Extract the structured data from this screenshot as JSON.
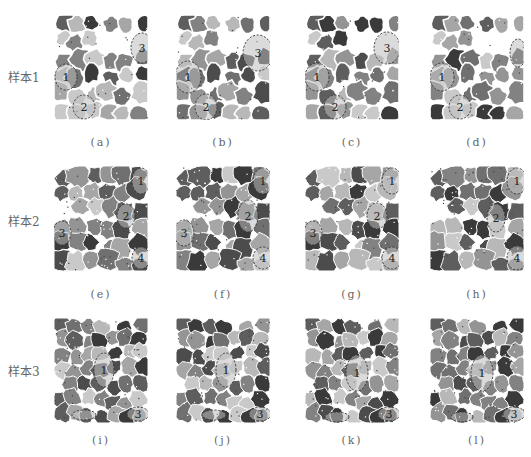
{
  "figure": {
    "rows": [
      {
        "label": "样本1",
        "panels": [
          {
            "caption": "(a)",
            "markers": [
              {
                "n": "1",
                "x": 12,
                "y": 62,
                "rx": 11,
                "ry": 13
              },
              {
                "n": "2",
                "x": 30,
                "y": 92,
                "rx": 11,
                "ry": 12
              },
              {
                "n": "3",
                "x": 88,
                "y": 33,
                "rx": 11,
                "ry": 15
              }
            ]
          },
          {
            "caption": "(b)",
            "markers": [
              {
                "n": "1",
                "x": 12,
                "y": 62,
                "rx": 13,
                "ry": 16
              },
              {
                "n": "2",
                "x": 30,
                "y": 92,
                "rx": 11,
                "ry": 13
              },
              {
                "n": "3",
                "x": 82,
                "y": 38,
                "rx": 15,
                "ry": 18
              }
            ]
          },
          {
            "caption": "(c)",
            "markers": [
              {
                "n": "1",
                "x": 12,
                "y": 62,
                "rx": 12,
                "ry": 14
              },
              {
                "n": "2",
                "x": 30,
                "y": 92,
                "rx": 11,
                "ry": 12
              },
              {
                "n": "3",
                "x": 82,
                "y": 33,
                "rx": 13,
                "ry": 16
              }
            ]
          },
          {
            "caption": "(d)",
            "markers": [
              {
                "n": "1",
                "x": 12,
                "y": 62,
                "rx": 12,
                "ry": 14
              },
              {
                "n": "2",
                "x": 30,
                "y": 92,
                "rx": 11,
                "ry": 12
              },
              {
                "n": "",
                "x": 88,
                "y": 38,
                "rx": 8,
                "ry": 14
              }
            ]
          }
        ]
      },
      {
        "label": "样本2",
        "panels": [
          {
            "caption": "(e)",
            "markers": [
              {
                "n": "1",
                "x": 87,
                "y": 15,
                "rx": 9,
                "ry": 13
              },
              {
                "n": "2",
                "x": 72,
                "y": 50,
                "rx": 9,
                "ry": 12
              },
              {
                "n": "3",
                "x": 8,
                "y": 67,
                "rx": 9,
                "ry": 12
              },
              {
                "n": "4",
                "x": 87,
                "y": 92,
                "rx": 9,
                "ry": 11
              }
            ]
          },
          {
            "caption": "(f)",
            "markers": [
              {
                "n": "1",
                "x": 87,
                "y": 15,
                "rx": 10,
                "ry": 13
              },
              {
                "n": "2",
                "x": 72,
                "y": 50,
                "rx": 10,
                "ry": 16
              },
              {
                "n": "3",
                "x": 8,
                "y": 67,
                "rx": 10,
                "ry": 13
              },
              {
                "n": "4",
                "x": 87,
                "y": 92,
                "rx": 10,
                "ry": 11
              }
            ]
          },
          {
            "caption": "(g)",
            "markers": [
              {
                "n": "1",
                "x": 87,
                "y": 15,
                "rx": 10,
                "ry": 13
              },
              {
                "n": "2",
                "x": 72,
                "y": 50,
                "rx": 10,
                "ry": 13
              },
              {
                "n": "3",
                "x": 8,
                "y": 67,
                "rx": 9,
                "ry": 12
              },
              {
                "n": "4",
                "x": 87,
                "y": 92,
                "rx": 10,
                "ry": 11
              }
            ]
          },
          {
            "caption": "(h)",
            "markers": [
              {
                "n": "1",
                "x": 87,
                "y": 15,
                "rx": 10,
                "ry": 13
              },
              {
                "n": "2",
                "x": 66,
                "y": 52,
                "rx": 9,
                "ry": 14
              },
              {
                "n": "",
                "x": 8,
                "y": 67,
                "rx": 0,
                "ry": 0
              },
              {
                "n": "4",
                "x": 87,
                "y": 92,
                "rx": 10,
                "ry": 12
              }
            ]
          }
        ]
      },
      {
        "label": "样本3",
        "panels": [
          {
            "caption": "(i)",
            "markers": [
              {
                "n": "1",
                "x": 50,
                "y": 52,
                "rx": 10,
                "ry": 17
              },
              {
                "n": "",
                "x": 30,
                "y": 97,
                "rx": 12,
                "ry": 5
              },
              {
                "n": "3",
                "x": 84,
                "y": 96,
                "rx": 11,
                "ry": 7
              }
            ]
          },
          {
            "caption": "(j)",
            "markers": [
              {
                "n": "1",
                "x": 50,
                "y": 52,
                "rx": 10,
                "ry": 17
              },
              {
                "n": "",
                "x": 38,
                "y": 97,
                "rx": 12,
                "ry": 5
              },
              {
                "n": "3",
                "x": 84,
                "y": 96,
                "rx": 11,
                "ry": 7
              }
            ]
          },
          {
            "caption": "(k)",
            "markers": [
              {
                "n": "1",
                "x": 52,
                "y": 55,
                "rx": 11,
                "ry": 18
              },
              {
                "n": "",
                "x": 32,
                "y": 99,
                "rx": 12,
                "ry": 5
              },
              {
                "n": "3",
                "x": 84,
                "y": 96,
                "rx": 11,
                "ry": 7
              }
            ]
          },
          {
            "caption": "(l)",
            "markers": [
              {
                "n": "1",
                "x": 52,
                "y": 55,
                "rx": 11,
                "ry": 18
              },
              {
                "n": "",
                "x": 32,
                "y": 99,
                "rx": 11,
                "ry": 5
              },
              {
                "n": "3",
                "x": 84,
                "y": 96,
                "rx": 11,
                "ry": 7
              }
            ]
          }
        ]
      }
    ]
  }
}
